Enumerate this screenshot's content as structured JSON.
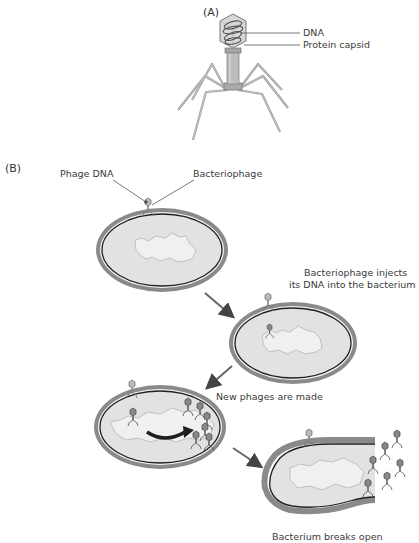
{
  "panel_a": {
    "label": "(A)",
    "callouts": [
      "DNA",
      "Protein capsid"
    ]
  },
  "panel_b": {
    "label": "(B)",
    "callouts": [
      "Phage DNA",
      "Bacteriophage"
    ],
    "steps": [
      {
        "line1": "Bacteriophage injects",
        "line2": "its DNA into the bacterium"
      },
      {
        "line1": "New phages are made"
      },
      {
        "line1": "Bacterium breaks open"
      }
    ]
  },
  "colors": {
    "cell_wall": "#8a8a8a",
    "cell_fill": "#e2e2e2",
    "membrane": "#1e1e1e",
    "nucleoid": "#f0f0f0",
    "arrow": "#555555",
    "phage": "#9a9a9a"
  }
}
